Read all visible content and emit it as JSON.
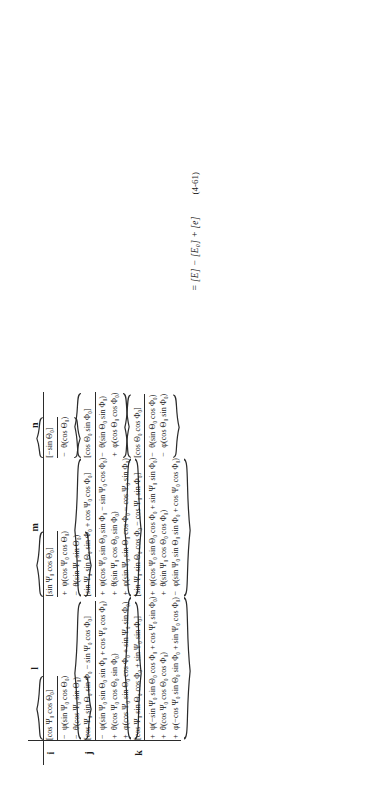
{
  "document": {
    "type": "mathematical-equation-plate",
    "equation_number": "(4-61)",
    "final_expression": "= [E] − [E₀] + [e]",
    "orientation": "rotated-90-ccw"
  },
  "matrix": {
    "column_headers": [
      "l",
      "m",
      "n"
    ],
    "row_headers": [
      "i",
      "j",
      "k"
    ],
    "cells": {
      "i": {
        "l": {
          "lead": "[cos Ψ₀ cos Θ₀]",
          "terms": [
            {
              "op": "−",
              "body": "ψ(sin Ψ₀ cos Θ₀)"
            },
            {
              "op": "−",
              "body": "θ(cos Ψ₀ sin Θ₀)"
            }
          ]
        },
        "m": {
          "lead": "[sin Ψ₀ cos Θ₀]",
          "terms": [
            {
              "op": "+",
              "body": "ψ(cos Ψ₀ cos Θ₀)"
            },
            {
              "op": "−",
              "body": "θ(sin Ψ₀ sin Θ₀)"
            }
          ]
        },
        "n": {
          "lead": "[−sin Θ₀]",
          "terms": [
            {
              "op": "−",
              "body": "θ(cos Θ₀)"
            }
          ]
        }
      },
      "j": {
        "l": {
          "lead": "[cos Ψ₀ sin Θ₀ sin Φ₀ − sin Ψ₀ cos Φ₀]",
          "terms": [
            {
              "op": "−",
              "body": "ψ(sin Ψ₀ sin Θ₀ sin Φ₀ + cos Ψ₀ cos Φ₀)"
            },
            {
              "op": "+",
              "body": "θ(cos Ψ₀ cos Θ₀ sin Φ₀)"
            },
            {
              "op": "+",
              "body": "φ(cos Ψ₀ sin Θ₀ cos Φ₀ + sin Ψ₀ sin Φ₀)"
            }
          ]
        },
        "m": {
          "lead": "[sin Ψ₀ sin Θ₀ sin Φ₀ + cos Ψ₀ cos Φ₀]",
          "terms": [
            {
              "op": "+",
              "body": "ψ(cos Ψ₀ sin Θ₀ sin Φ₀ − sin Ψ₀ cos Φ₀)"
            },
            {
              "op": "+",
              "body": "θ(sin Ψ₀ cos Θ₀ sin Φ₀)"
            },
            {
              "op": "+",
              "body": "φ(sin Ψ₀ sin Θ₀ cos Φ₀ − cos Ψ₀ sin Φ₀)"
            }
          ]
        },
        "n": {
          "lead": "[cos Θ₀ sin Φ₀]",
          "terms": [
            {
              "op": "−",
              "body": "θ(sin Θ₀ sin Φ₀)"
            },
            {
              "op": "+",
              "body": "φ(cos Θ₀ cos Φ₀)"
            }
          ]
        }
      },
      "k": {
        "l": {
          "lead": "[cos Ψ₀ sin Θ₀ cos Φ₀ + sin Ψ₀ sin Φ₀]",
          "terms": [
            {
              "op": "+",
              "body": "ψ(−sin Ψ₀ sin Θ₀ cos Φ₀ + cos Ψ₀ sin Φ₀)"
            },
            {
              "op": "+",
              "body": "θ(cos Ψ₀ cos Θ₀ cos Φ₀)"
            },
            {
              "op": "+",
              "body": "φ(−cos Ψ₀ sin Θ₀ sin Φ₀ + sin Ψ₀ cos Φ₀)"
            }
          ]
        },
        "m": {
          "lead": "[sin Ψ₀ sin Θ₀ cos Φ₀ − cos Ψ₀ sin Φ₀]",
          "terms": [
            {
              "op": "+",
              "body": "ψ(cos Ψ₀ sin Θ₀ cos Φ₀ + sin Ψ₀ sin Φ₀)"
            },
            {
              "op": "+",
              "body": "θ(sin Ψ₀ cos Θ₀ cos Φ₀)"
            },
            {
              "op": "−",
              "body": "φ(sin Ψ₀ sin Θ₀ sin Φ₀ + cos Ψ₀ cos Φ₀)"
            }
          ]
        },
        "n": {
          "lead": "[cos Θ₀ cos Φ₀]",
          "terms": [
            {
              "op": "−",
              "body": "θ(sin Θ₀ cos Φ₀)"
            },
            {
              "op": "−",
              "body": "φ(cos Θ₀ sin Φ₀)"
            }
          ]
        }
      }
    }
  }
}
